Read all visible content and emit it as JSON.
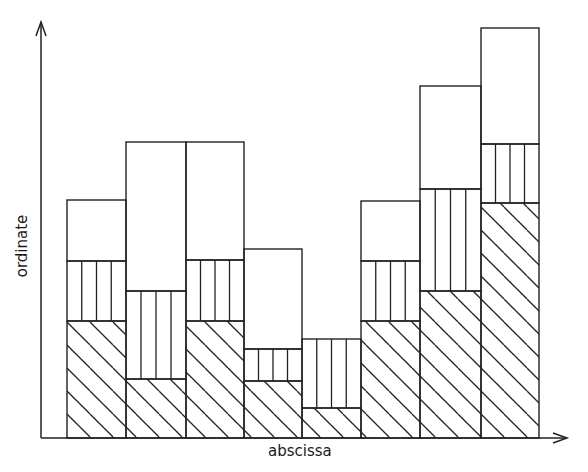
{
  "chart_data": {
    "type": "bar",
    "stacked": true,
    "title": "",
    "xlabel": "abscissa",
    "ylabel": "ordinate",
    "categories": [
      "1",
      "2",
      "3",
      "4",
      "5",
      "6",
      "7",
      "8"
    ],
    "series": [
      {
        "name": "diagonal-hatched",
        "pattern": "diagonal",
        "values": [
          117,
          59,
          117,
          57,
          30,
          117,
          147,
          235
        ]
      },
      {
        "name": "vertical-striped",
        "pattern": "vertical",
        "values": [
          60,
          88,
          61,
          32,
          69,
          60,
          102,
          59
        ]
      },
      {
        "name": "blank",
        "pattern": "none",
        "values": [
          61,
          149,
          118,
          100,
          0,
          60,
          103,
          116
        ]
      }
    ],
    "totals": [
      238,
      296,
      296,
      189,
      99,
      237,
      352,
      410
    ],
    "ylim": [
      0,
      416
    ],
    "grid": false,
    "legend": null,
    "ticks": "none"
  },
  "layout": {
    "baseline_y": 438,
    "axis_x": 41,
    "y_axis_top": 22,
    "x_axis_right": 567,
    "bar_edges": [
      67,
      126,
      186,
      244,
      302,
      361,
      420,
      481,
      539
    ],
    "stroke_color": "#222222",
    "background": "#ffffff"
  }
}
